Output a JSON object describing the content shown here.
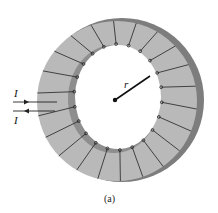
{
  "figure": {
    "caption": "(a)",
    "radius_label": "r",
    "current_in_label": "I",
    "current_out_label": "I",
    "colors": {
      "ring_face": "#b9b9b9",
      "ring_inner_wall": "#8e8e8e",
      "ring_outer_wall": "#7d7d7d",
      "winding": "#222222",
      "background": "#ffffff"
    },
    "winding_count": 22
  }
}
